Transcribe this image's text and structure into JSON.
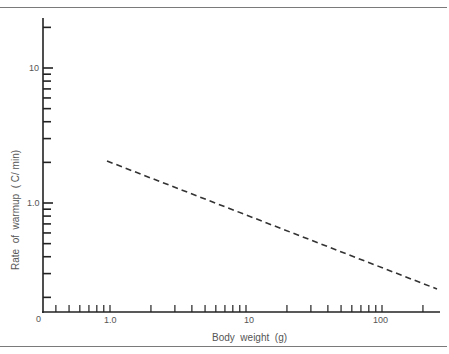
{
  "chart_data": {
    "type": "line",
    "title": "",
    "xlabel": "Body weight (g)",
    "ylabel": "Rate of warmup (C/min)",
    "x_scale": "log",
    "y_scale": "log",
    "x_tick_labels": [
      "0",
      "1.0",
      "10",
      "100"
    ],
    "y_tick_labels": [
      "10",
      "1.0"
    ],
    "xlim": [
      0.4,
      260
    ],
    "ylim": [
      0.12,
      30
    ],
    "grid": false,
    "legend": null,
    "series": [
      {
        "name": "warmup rate vs body weight",
        "style": "dashed",
        "x": [
          1.0,
          10,
          100,
          250
        ],
        "y": [
          2.05,
          1.0,
          0.48,
          0.23
        ]
      }
    ]
  },
  "axes": {
    "origin_label": "0",
    "x_major_labels": [
      {
        "value": 1.0,
        "text": "1.0"
      },
      {
        "value": 10,
        "text": "10"
      },
      {
        "value": 100,
        "text": "100"
      }
    ],
    "y_major_labels": [
      {
        "value": 10,
        "text": "10"
      },
      {
        "value": 1.0,
        "text": "1.0"
      }
    ]
  },
  "labels": {
    "x_axis": "Body  weight  (g)",
    "y_axis": "Rate  of  warmup  ( C/ min)",
    "origin": "0",
    "x_1": "1.0",
    "x_10": "10",
    "x_100": "100",
    "y_10": "10",
    "y_1": "1.0"
  }
}
